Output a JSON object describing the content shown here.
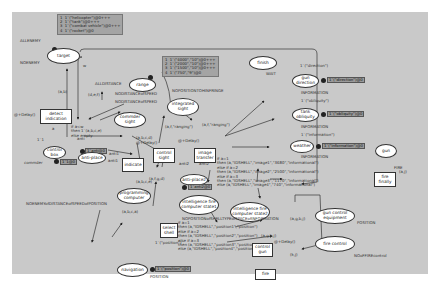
{
  "top_marking": [
    "1  1`(\"helicopter\")@0+++",
    "2  1`(\"tank\")@0+++",
    "3  1`(\"combat vehicle\")@0+++",
    "4  1`(\"rocket\")@0"
  ],
  "range_marking": [
    "1  1`(\"4000\",\"10\")@0+++",
    "2  1`(\"2000\",\"10\")@0+++",
    "3  1`(\"1500\",\"10\")@0+++",
    "4  1`(\"750\",\"9\")@0"
  ],
  "places": {
    "target": "target",
    "range": "range",
    "finish": "finish",
    "gun_direction": "gun direction",
    "tank_obliquity": "tank obliquity",
    "weather": "weather",
    "gun": "gun",
    "commder_sight": "commder sight",
    "integrated_sight": "integrated sight",
    "control_box": "control box",
    "anti_place": "anti-place",
    "anti_place2": "anti-place2",
    "programming_computer": "programming computer",
    "ifc_state1": "intelligence fire computer state1",
    "ifc_state2": "intelligence fire computer state2",
    "gun_control_equipment": "gun control equipment",
    "fire_control": "fire control",
    "navigation": "navigation"
  },
  "transitions": {
    "detect_indication": "detect indication",
    "indicate": "indicate",
    "control_sight": "control sight",
    "image_transfer": "image transfer",
    "fire_finally": "fire finally",
    "select_shell": "select shell",
    "control_gun": "control gun",
    "fire": "fire"
  },
  "labels": {
    "allenemy": "ALLENEMY",
    "noenemy": "NOENEMY",
    "ab": "(a,b)",
    "w": "w",
    "alldistance": "ALLDISTANCE",
    "def": "(d,e,f)",
    "nodistanceofspeed": "NODISTANCEofSPEED",
    "nodistanceofspeed2": "NODISTANCEofSPEED",
    "nopositiontohinfringe": "NOPOSITIONTOHINFRINGE",
    "wait": "WAIT",
    "direction_arc": "1`(\"direction\")",
    "information1": "INFORMATION",
    "obliquity_arc": "1`(\"obliquity\")",
    "information2": "INFORMATION",
    "information_arc": "1`(\"information\")",
    "information3": "INFORMATION",
    "fire_lbl": "FIRE",
    "delay1": "@+Delay()",
    "guard_detect": "if a<w\nthen 1`(a,b,c,e)\nelse empty",
    "anti": "anti",
    "anti1": "anti1",
    "anti2": "anti2",
    "one": "1`1",
    "commder": "commder",
    "abcd": "(a,b,c,d)",
    "abce": "(a,b,c,e)",
    "delay2": "@+Delay()",
    "afrang": "(a,f,\"ranging\")",
    "afrang2": "(a,f,\"ranging\")",
    "delay3": "@+Delay()",
    "afgd": "(a,f,g,d)",
    "anti2b": "anti2",
    "image_guard": "if a=1\nthen (a,\"IDSHELL\",\"image1\",\"3680\",\"informational\")\nelse if a=2\nthen (a,\"IDSHELL\",\"image2\",\"2500\",\"informational\")\nelse if a=3\nthen (a,\"IDSHELL\",\"image3\",\"1170\",\"informational\")\nelse (a,\"IDSHELL\",\"image4\",\"740\",\"informational\")",
    "noenemyofdist": "NOENEMYofDISTANCEofSPEEDofPOSITION",
    "abca": "(a,b,c,a)",
    "shell_guard": "if a=1\nthen (a,\"IDSHELL\",\"position1\",\"position\")\nelse if a=2\nthen (a,\"IDSHELL\",\"position2\",\"position\")\nelse if a=3\nthen (a,\"IDSHELL\",\"position3\",\"position\")\nelse (a,\"IDSHELL\",\"position4\",\"position\")",
    "nopositionofshell": "NOPOSITIONofSHELLTYPEofSPACEofINFORMATION",
    "agbj": "(a,g,b,j)",
    "agbj2": "(a,g,b,j)",
    "kj": "(k,j)",
    "delay4": "@+Delay()",
    "position_lbl": "POSITION",
    "nooffire": "NOoFFIREcontrol",
    "position_arc": "1`(\"position\")",
    "position2": "POSITION",
    "aj": "(a,j)",
    "k": "k",
    "j": "j",
    "i": "i"
  },
  "markings": {
    "direction": "1`(\"direction\")@0",
    "obliquity": "1`(\"obliquity\")@0",
    "information": "1`(\"information\")@0",
    "control_box": "1`1@0",
    "anti": "1`anti@0",
    "anti2": "1`anti2@0",
    "position": "1`(\"position\")@0"
  }
}
